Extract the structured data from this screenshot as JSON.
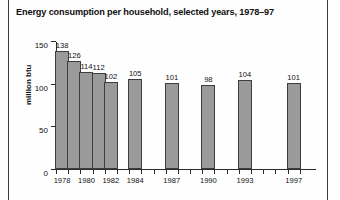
{
  "chart_data": {
    "type": "bar",
    "title": "Energy consumption per household, selected years, 1978–97",
    "xlabel": "",
    "ylabel": "million btu",
    "categories": [
      "1978",
      "1979",
      "1980",
      "1981",
      "1982",
      "1984",
      "1987",
      "1990",
      "1993",
      "1997"
    ],
    "values": [
      138,
      126,
      114,
      112,
      102,
      105,
      101,
      98,
      104,
      101
    ],
    "ylim": [
      0,
      150
    ],
    "yticks": [
      0,
      50,
      100,
      150
    ],
    "xtick_labels": [
      "1978",
      "1980",
      "1982",
      "1984",
      "1987",
      "1990",
      "1993",
      "1997"
    ],
    "x_axis_range": [
      1977.5,
      1998.5
    ],
    "grid": false,
    "legend": false,
    "bar_color": "#9a9a9a",
    "bar_edge_color": "#3d3d3d"
  }
}
